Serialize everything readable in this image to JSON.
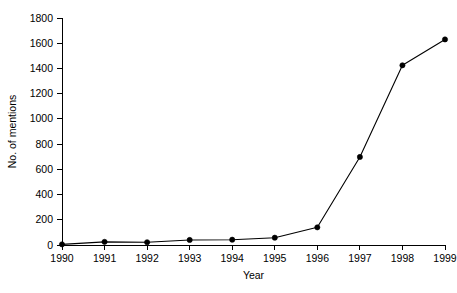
{
  "chart_data": {
    "type": "line",
    "title": "",
    "xlabel": "Year",
    "ylabel": "No. of mentions",
    "categories": [
      "1990",
      "1991",
      "1992",
      "1993",
      "1994",
      "1995",
      "1996",
      "1997",
      "1998",
      "1999"
    ],
    "x": [
      1990,
      1991,
      1992,
      1993,
      1994,
      1995,
      1996,
      1997,
      1998,
      1999
    ],
    "values": [
      5,
      25,
      22,
      40,
      42,
      58,
      140,
      698,
      1425,
      1630
    ],
    "series": [
      {
        "name": "No. of mentions",
        "values": [
          5,
          25,
          22,
          40,
          42,
          58,
          140,
          698,
          1425,
          1630
        ]
      }
    ],
    "xlim": [
      1990,
      1999
    ],
    "ylim": [
      0,
      1800
    ],
    "ytick_labels": [
      "0",
      "200",
      "400",
      "600",
      "800",
      "1000",
      "1200",
      "1400",
      "1600",
      "1800"
    ],
    "ytick_values": [
      0,
      200,
      400,
      600,
      800,
      1000,
      1200,
      1400,
      1600,
      1800
    ],
    "xtick_labels": [
      "1990",
      "1991",
      "1992",
      "1993",
      "1994",
      "1995",
      "1996",
      "1997",
      "1998",
      "1999"
    ],
    "grid": false,
    "legend": false,
    "legend_position": "none",
    "marker": "circle",
    "line_color": "#000000",
    "marker_color": "#000000",
    "background_color": "#ffffff"
  }
}
